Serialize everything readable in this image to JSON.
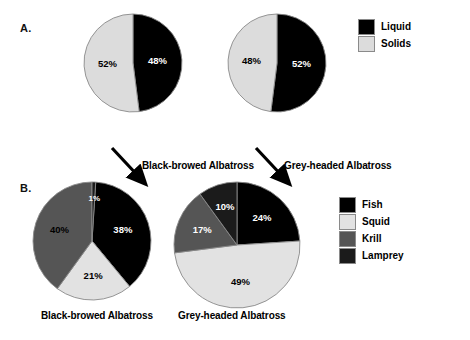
{
  "figure": {
    "panels": [
      {
        "letter": "A."
      },
      {
        "letter": "B."
      }
    ]
  },
  "colors": {
    "liquid": "#000000",
    "solids": "#dcdcdc",
    "fish": "#000000",
    "squid": "#e2e2e2",
    "krill": "#555555",
    "lamprey": "#1b1b1b",
    "outline": "#8a8a8a",
    "background": "#ffffff"
  },
  "panelA": {
    "letter": "A.",
    "legend": {
      "items": [
        {
          "label": "Liquid",
          "color": "#000000"
        },
        {
          "label": "Solids",
          "color": "#dcdcdc"
        }
      ]
    },
    "charts": [
      {
        "species": "Black-browed Albatross",
        "slices": [
          {
            "label": "48%",
            "value": 48,
            "category": "Liquid",
            "color": "#000000",
            "text": "light"
          },
          {
            "label": "52%",
            "value": 52,
            "category": "Solids",
            "color": "#dcdcdc",
            "text": "dark"
          }
        ]
      },
      {
        "species": "Grey-headed Albatross",
        "slices": [
          {
            "label": "52%",
            "value": 52,
            "category": "Liquid",
            "color": "#000000",
            "text": "light"
          },
          {
            "label": "48%",
            "value": 48,
            "category": "Solids",
            "color": "#dcdcdc",
            "text": "dark"
          }
        ]
      }
    ]
  },
  "panelB": {
    "letter": "B.",
    "legend": {
      "items": [
        {
          "label": "Fish",
          "color": "#000000"
        },
        {
          "label": "Squid",
          "color": "#e2e2e2"
        },
        {
          "label": "Krill",
          "color": "#555555"
        },
        {
          "label": "Lamprey",
          "color": "#1b1b1b"
        }
      ]
    },
    "charts": [
      {
        "species": "Black-browed Albatross",
        "slices": [
          {
            "label": "38%",
            "value": 38,
            "category": "Fish",
            "color": "#000000",
            "text": "light"
          },
          {
            "label": "21%",
            "value": 21,
            "category": "Squid",
            "color": "#e2e2e2",
            "text": "dark"
          },
          {
            "label": "40%",
            "value": 40,
            "category": "Krill",
            "color": "#555555",
            "text": "dark"
          },
          {
            "label": "1%",
            "value": 1,
            "category": "Lamprey",
            "color": "#1b1b1b",
            "text": "light"
          }
        ]
      },
      {
        "species": "Grey-headed Albatross",
        "slices": [
          {
            "label": "24%",
            "value": 24,
            "category": "Fish",
            "color": "#000000",
            "text": "light"
          },
          {
            "label": "49%",
            "value": 49,
            "category": "Squid",
            "color": "#e2e2e2",
            "text": "dark"
          },
          {
            "label": "17%",
            "value": 17,
            "category": "Krill",
            "color": "#555555",
            "text": "light"
          },
          {
            "label": "10%",
            "value": 10,
            "category": "Lamprey",
            "color": "#1b1b1b",
            "text": "light"
          }
        ]
      }
    ]
  },
  "chart_data": [
    {
      "type": "pie",
      "title": "Black-browed Albatross — stomach content by state",
      "panel": "A",
      "categories": [
        "Liquid",
        "Solids"
      ],
      "values": [
        48,
        52
      ],
      "labels": [
        "48%",
        "52%"
      ],
      "legend_position": "right",
      "units": "percent"
    },
    {
      "type": "pie",
      "title": "Grey-headed Albatross — stomach content by state",
      "panel": "A",
      "categories": [
        "Liquid",
        "Solids"
      ],
      "values": [
        52,
        48
      ],
      "labels": [
        "52%",
        "48%"
      ],
      "legend_position": "right",
      "units": "percent"
    },
    {
      "type": "pie",
      "title": "Black-browed Albatross — solid prey composition",
      "panel": "B",
      "categories": [
        "Fish",
        "Squid",
        "Krill",
        "Lamprey"
      ],
      "values": [
        38,
        21,
        40,
        1
      ],
      "labels": [
        "38%",
        "21%",
        "40%",
        "1%"
      ],
      "legend_position": "right",
      "units": "percent"
    },
    {
      "type": "pie",
      "title": "Grey-headed Albatross — solid prey composition",
      "panel": "B",
      "categories": [
        "Fish",
        "Squid",
        "Krill",
        "Lamprey"
      ],
      "values": [
        24,
        49,
        17,
        10
      ],
      "labels": [
        "24%",
        "49%",
        "17%",
        "10%"
      ],
      "legend_position": "right",
      "units": "percent"
    }
  ]
}
